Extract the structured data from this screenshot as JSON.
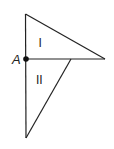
{
  "diagram": {
    "point_label": "A",
    "region_labels": [
      "I",
      "II"
    ],
    "stroke_color": "#222222",
    "background": "#ffffff",
    "vertices": {
      "top": [
        25,
        14
      ],
      "A": [
        26,
        59
      ],
      "right": [
        105,
        59
      ],
      "mid": [
        71,
        59
      ],
      "bottom": [
        26,
        138
      ]
    }
  }
}
